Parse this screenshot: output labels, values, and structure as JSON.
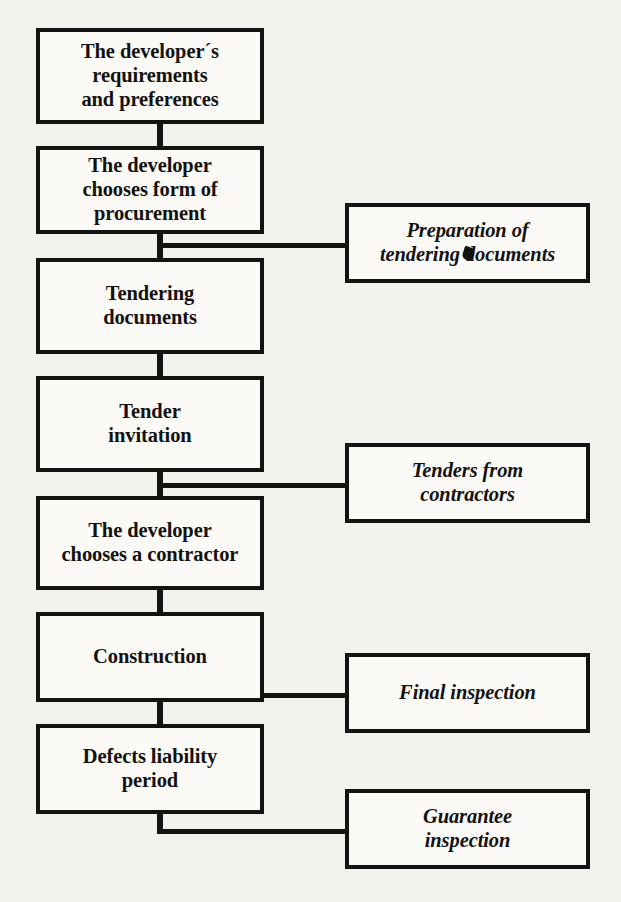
{
  "diagram": {
    "colors": {
      "background": "#f3f1ec",
      "box_fill": "#fbfaf7",
      "ink": "#151311"
    },
    "main_nodes": [
      {
        "id": "requirements",
        "lines": [
          "The developer´s",
          "requirements",
          "and preferences"
        ]
      },
      {
        "id": "procurement",
        "lines": [
          "The developer",
          "chooses form of",
          "procurement"
        ]
      },
      {
        "id": "tender-docs",
        "lines": [
          "Tendering",
          "documents"
        ]
      },
      {
        "id": "tender-invite",
        "lines": [
          "Tender",
          "invitation"
        ]
      },
      {
        "id": "choose-contractor",
        "lines": [
          "The developer",
          "chooses a contractor"
        ]
      },
      {
        "id": "construction",
        "lines": [
          "Construction"
        ]
      },
      {
        "id": "defects",
        "lines": [
          "Defects liability",
          "period"
        ]
      }
    ],
    "side_nodes": [
      {
        "id": "preparation",
        "lines": [
          "Preparation of",
          "tendering documents"
        ],
        "artifact": "smudge-over-n"
      },
      {
        "id": "tenders",
        "lines": [
          "Tenders from",
          "contractors"
        ]
      },
      {
        "id": "final-insp",
        "lines": [
          "Final inspection"
        ]
      },
      {
        "id": "guarantee",
        "lines": [
          "Guarantee",
          "inspection"
        ]
      }
    ]
  }
}
